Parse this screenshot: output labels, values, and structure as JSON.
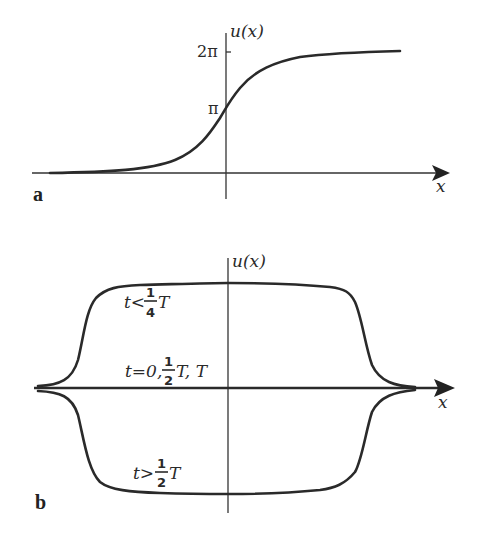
{
  "panel_a": {
    "label": "a",
    "y_axis_label": "u(x)",
    "x_axis_label": "x",
    "ticks": {
      "two_pi": "2π",
      "pi": "π"
    }
  },
  "panel_b": {
    "label": "b",
    "y_axis_label": "u(x)",
    "x_axis_label": "x",
    "curve_labels": {
      "upper": {
        "prefix": "t<",
        "num": "1",
        "den": "4",
        "suffix": "T"
      },
      "middle": {
        "prefix": "t=0,",
        "num": "1",
        "den": "2",
        "suffix": "T, T"
      },
      "lower": {
        "prefix": "t>",
        "num": "1",
        "den": "2",
        "suffix": "T"
      }
    }
  },
  "colors": {
    "stroke": "#2a2a2a",
    "background": "#ffffff"
  }
}
